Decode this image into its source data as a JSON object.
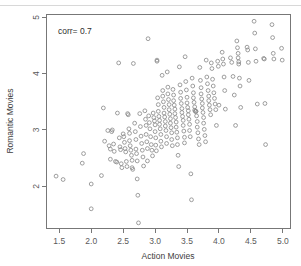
{
  "chart_data": {
    "type": "scatter",
    "title": "",
    "xlabel": "Action Movies",
    "ylabel": "Romantic Movies",
    "xlim": [
      1.3,
      5.12
    ],
    "ylim": [
      1.25,
      5.05
    ],
    "xticks": [
      1.5,
      2.0,
      2.5,
      3.0,
      3.5,
      4.0,
      4.5,
      5.0
    ],
    "xtick_labels": [
      "1.5",
      "2.0",
      "2.5",
      "3.0",
      "3.5",
      "4.0",
      "4.5",
      "5.0"
    ],
    "yticks": [
      2,
      3,
      4,
      5
    ],
    "ytick_labels": [
      "2",
      "3",
      "4",
      "5"
    ],
    "grid": false,
    "legend": null,
    "marker": "open-circle",
    "marker_color": "#8c8c8c",
    "frame_color": "#777777",
    "annotations": [
      {
        "text": "corr= 0.7",
        "x": 1.48,
        "y": 4.7,
        "align": "left"
      }
    ],
    "points": [
      [
        1.45,
        2.18
      ],
      [
        1.56,
        2.12
      ],
      [
        1.88,
        2.58
      ],
      [
        1.86,
        2.41
      ],
      [
        2.0,
        2.04
      ],
      [
        2.0,
        1.6
      ],
      [
        2.16,
        2.19
      ],
      [
        2.19,
        3.39
      ],
      [
        2.21,
        2.8
      ],
      [
        2.26,
        2.99
      ],
      [
        2.28,
        2.72
      ],
      [
        2.3,
        2.66
      ],
      [
        2.3,
        2.48
      ],
      [
        2.32,
        2.97
      ],
      [
        2.33,
        3.0
      ],
      [
        2.35,
        2.75
      ],
      [
        2.36,
        2.62
      ],
      [
        2.38,
        2.44
      ],
      [
        2.4,
        2.43
      ],
      [
        2.41,
        3.3
      ],
      [
        2.43,
        4.19
      ],
      [
        2.44,
        2.86
      ],
      [
        2.45,
        2.7
      ],
      [
        2.46,
        2.65
      ],
      [
        2.47,
        2.4
      ],
      [
        2.48,
        2.33
      ],
      [
        2.5,
        2.93
      ],
      [
        2.51,
        2.88
      ],
      [
        2.52,
        2.78
      ],
      [
        2.53,
        2.67
      ],
      [
        2.54,
        2.61
      ],
      [
        2.55,
        2.44
      ],
      [
        2.56,
        2.35
      ],
      [
        2.57,
        3.29
      ],
      [
        2.58,
        3.27
      ],
      [
        2.59,
        3.02
      ],
      [
        2.6,
        2.94
      ],
      [
        2.6,
        2.81
      ],
      [
        2.61,
        2.72
      ],
      [
        2.62,
        2.64
      ],
      [
        2.63,
        2.55
      ],
      [
        2.64,
        2.46
      ],
      [
        2.64,
        2.33
      ],
      [
        2.65,
        2.3
      ],
      [
        2.66,
        4.18
      ],
      [
        2.68,
        3.12
      ],
      [
        2.69,
        2.97
      ],
      [
        2.7,
        2.83
      ],
      [
        2.7,
        2.66
      ],
      [
        2.71,
        2.58
      ],
      [
        2.72,
        2.45
      ],
      [
        2.72,
        2.13
      ],
      [
        2.73,
        1.84
      ],
      [
        2.74,
        1.35
      ],
      [
        2.76,
        3.29
      ],
      [
        2.77,
        3.06
      ],
      [
        2.78,
        2.89
      ],
      [
        2.79,
        2.76
      ],
      [
        2.8,
        2.64
      ],
      [
        2.81,
        2.52
      ],
      [
        2.82,
        2.36
      ],
      [
        2.84,
        3.34
      ],
      [
        2.85,
        3.19
      ],
      [
        2.86,
        3.08
      ],
      [
        2.86,
        2.92
      ],
      [
        2.87,
        2.79
      ],
      [
        2.88,
        2.67
      ],
      [
        2.88,
        2.45
      ],
      [
        2.89,
        4.62
      ],
      [
        2.9,
        3.25
      ],
      [
        2.91,
        3.13
      ],
      [
        2.92,
        3.02
      ],
      [
        2.93,
        2.88
      ],
      [
        2.94,
        2.74
      ],
      [
        2.95,
        2.64
      ],
      [
        2.96,
        2.54
      ],
      [
        2.97,
        3.3
      ],
      [
        2.98,
        3.22
      ],
      [
        2.99,
        3.16
      ],
      [
        3.0,
        3.09
      ],
      [
        3.0,
        2.97
      ],
      [
        3.01,
        2.86
      ],
      [
        3.01,
        2.73
      ],
      [
        3.02,
        2.63
      ],
      [
        3.03,
        4.24
      ],
      [
        3.03,
        4.22
      ],
      [
        3.04,
        3.57
      ],
      [
        3.05,
        3.45
      ],
      [
        3.05,
        3.33
      ],
      [
        3.06,
        3.24
      ],
      [
        3.07,
        3.17
      ],
      [
        3.07,
        3.1
      ],
      [
        3.08,
        3.02
      ],
      [
        3.09,
        2.92
      ],
      [
        3.09,
        2.8
      ],
      [
        3.1,
        2.7
      ],
      [
        3.11,
        3.97
      ],
      [
        3.12,
        3.7
      ],
      [
        3.12,
        3.6
      ],
      [
        3.13,
        3.5
      ],
      [
        3.14,
        3.4
      ],
      [
        3.14,
        3.3
      ],
      [
        3.15,
        3.23
      ],
      [
        3.16,
        3.15
      ],
      [
        3.16,
        3.07
      ],
      [
        3.17,
        2.99
      ],
      [
        3.18,
        2.88
      ],
      [
        3.18,
        2.76
      ],
      [
        3.19,
        4.03
      ],
      [
        3.2,
        3.76
      ],
      [
        3.2,
        3.64
      ],
      [
        3.21,
        3.54
      ],
      [
        3.22,
        3.45
      ],
      [
        3.22,
        3.36
      ],
      [
        3.23,
        3.28
      ],
      [
        3.24,
        3.2
      ],
      [
        3.24,
        3.12
      ],
      [
        3.25,
        3.04
      ],
      [
        3.26,
        2.95
      ],
      [
        3.26,
        2.83
      ],
      [
        3.27,
        2.72
      ],
      [
        3.28,
        3.72
      ],
      [
        3.29,
        3.62
      ],
      [
        3.29,
        3.52
      ],
      [
        3.3,
        3.44
      ],
      [
        3.31,
        3.37
      ],
      [
        3.31,
        3.29
      ],
      [
        3.32,
        3.22
      ],
      [
        3.33,
        3.14
      ],
      [
        3.33,
        3.05
      ],
      [
        3.34,
        2.96
      ],
      [
        3.35,
        2.86
      ],
      [
        3.35,
        2.74
      ],
      [
        3.36,
        2.55
      ],
      [
        3.37,
        2.35
      ],
      [
        3.38,
        4.12
      ],
      [
        3.39,
        3.8
      ],
      [
        3.4,
        3.67
      ],
      [
        3.4,
        3.56
      ],
      [
        3.41,
        3.47
      ],
      [
        3.42,
        3.38
      ],
      [
        3.42,
        3.31
      ],
      [
        3.43,
        3.24
      ],
      [
        3.44,
        3.17
      ],
      [
        3.44,
        3.08
      ],
      [
        3.45,
        2.98
      ],
      [
        3.46,
        2.87
      ],
      [
        3.46,
        2.77
      ],
      [
        3.47,
        4.3
      ],
      [
        3.48,
        3.86
      ],
      [
        3.49,
        3.71
      ],
      [
        3.5,
        3.58
      ],
      [
        3.5,
        3.48
      ],
      [
        3.51,
        3.4
      ],
      [
        3.52,
        3.34
      ],
      [
        3.52,
        3.27
      ],
      [
        3.53,
        3.19
      ],
      [
        3.54,
        3.1
      ],
      [
        3.54,
        2.99
      ],
      [
        3.55,
        2.88
      ],
      [
        3.56,
        2.22
      ],
      [
        3.57,
        1.76
      ],
      [
        3.58,
        3.92
      ],
      [
        3.59,
        3.78
      ],
      [
        3.6,
        3.66
      ],
      [
        3.6,
        3.57
      ],
      [
        3.61,
        3.49
      ],
      [
        3.62,
        3.41
      ],
      [
        3.62,
        3.35
      ],
      [
        3.63,
        3.33
      ],
      [
        3.64,
        3.33
      ],
      [
        3.64,
        3.33
      ],
      [
        3.65,
        3.25
      ],
      [
        3.66,
        3.15
      ],
      [
        3.66,
        3.05
      ],
      [
        3.67,
        2.95
      ],
      [
        3.68,
        2.84
      ],
      [
        3.69,
        2.74
      ],
      [
        3.7,
        4.11
      ],
      [
        3.71,
        3.88
      ],
      [
        3.72,
        3.75
      ],
      [
        3.72,
        3.64
      ],
      [
        3.73,
        3.55
      ],
      [
        3.74,
        3.47
      ],
      [
        3.74,
        3.39
      ],
      [
        3.75,
        3.31
      ],
      [
        3.76,
        3.22
      ],
      [
        3.76,
        3.12
      ],
      [
        3.77,
        3.01
      ],
      [
        3.78,
        2.9
      ],
      [
        3.79,
        2.79
      ],
      [
        3.8,
        4.24
      ],
      [
        3.81,
        3.94
      ],
      [
        3.82,
        3.82
      ],
      [
        3.83,
        3.7
      ],
      [
        3.84,
        3.6
      ],
      [
        3.84,
        3.52
      ],
      [
        3.85,
        3.44
      ],
      [
        3.86,
        3.36
      ],
      [
        3.87,
        3.27
      ],
      [
        3.88,
        4.19
      ],
      [
        3.89,
        4.09
      ],
      [
        3.9,
        3.9
      ],
      [
        3.91,
        3.78
      ],
      [
        3.92,
        3.66
      ],
      [
        3.93,
        3.56
      ],
      [
        3.94,
        3.46
      ],
      [
        3.95,
        3.36
      ],
      [
        3.96,
        3.08
      ],
      [
        3.98,
        4.22
      ],
      [
        3.99,
        4.13
      ],
      [
        4.0,
        3.44
      ],
      [
        4.05,
        4.38
      ],
      [
        4.06,
        4.26
      ],
      [
        4.07,
        4.17
      ],
      [
        4.08,
        3.94
      ],
      [
        4.09,
        3.7
      ],
      [
        4.1,
        3.37
      ],
      [
        4.18,
        4.28
      ],
      [
        4.2,
        4.2
      ],
      [
        4.22,
        3.95
      ],
      [
        4.24,
        3.62
      ],
      [
        4.26,
        3.08
      ],
      [
        4.28,
        4.58
      ],
      [
        4.29,
        4.46
      ],
      [
        4.3,
        4.36
      ],
      [
        4.3,
        4.28
      ],
      [
        4.31,
        4.21
      ],
      [
        4.31,
        4.17
      ],
      [
        4.32,
        3.92
      ],
      [
        4.33,
        3.78
      ],
      [
        4.34,
        3.4
      ],
      [
        4.44,
        4.47
      ],
      [
        4.45,
        4.42
      ],
      [
        4.46,
        4.2
      ],
      [
        4.47,
        3.88
      ],
      [
        4.55,
        4.93
      ],
      [
        4.56,
        4.72
      ],
      [
        4.57,
        4.44
      ],
      [
        4.58,
        4.22
      ],
      [
        4.6,
        3.46
      ],
      [
        4.7,
        4.27
      ],
      [
        4.71,
        4.26
      ],
      [
        4.72,
        3.47
      ],
      [
        4.73,
        2.74
      ],
      [
        4.83,
        4.87
      ],
      [
        4.84,
        4.64
      ],
      [
        4.85,
        4.36
      ],
      [
        4.86,
        4.26
      ],
      [
        4.98,
        4.45
      ],
      [
        4.99,
        4.24
      ]
    ]
  }
}
